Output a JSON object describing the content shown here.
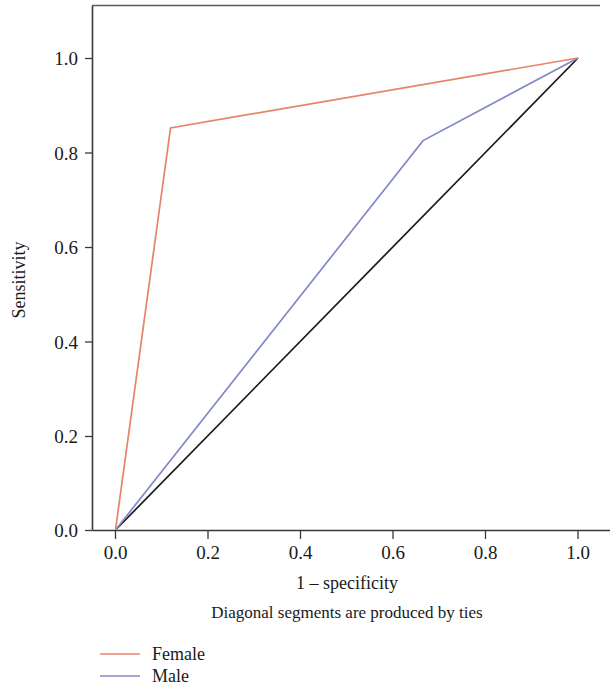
{
  "chart_data": {
    "type": "line",
    "title": "",
    "xlabel": "1 – specificity",
    "ylabel": "Sensitivity",
    "xlim": [
      0.0,
      1.0
    ],
    "ylim": [
      0.0,
      1.0
    ],
    "grid": false,
    "legend_position": "bottom-left",
    "annotation": "Diagonal segments are produced by ties",
    "xticks": [
      "0.0",
      "0.2",
      "0.4",
      "0.6",
      "0.8",
      "1.0"
    ],
    "xtick_values": [
      0.0,
      0.2,
      0.4,
      0.6,
      0.8,
      1.0
    ],
    "yticks": [
      "0.0",
      "0.2",
      "0.4",
      "0.6",
      "0.8",
      "1.0"
    ],
    "ytick_values": [
      0.0,
      0.2,
      0.4,
      0.6,
      0.8,
      1.0
    ],
    "series": [
      {
        "name": "Female",
        "color": "#E8836B",
        "x": [
          0.0,
          0.119,
          1.0
        ],
        "y": [
          0.0,
          0.852,
          1.0
        ]
      },
      {
        "name": "Male",
        "color": "#8288C8",
        "x": [
          0.0,
          0.665,
          1.0
        ],
        "y": [
          0.0,
          0.825,
          1.0
        ]
      },
      {
        "name": "Reference line",
        "color": "#1a1a1a",
        "x": [
          0.0,
          1.0
        ],
        "y": [
          0.0,
          1.0
        ]
      }
    ]
  },
  "axes": {
    "x_title": "1 – specificity",
    "y_title": "Sensitivity",
    "x_tick_labels": [
      "0.0",
      "0.2",
      "0.4",
      "0.6",
      "0.8",
      "1.0"
    ],
    "y_tick_labels": [
      "0.0",
      "0.2",
      "0.4",
      "0.6",
      "0.8",
      "1.0"
    ]
  },
  "caption": {
    "text": "Diagonal segments are produced by ties"
  },
  "legend": {
    "items": [
      {
        "label": "Female",
        "color": "#E8836B"
      },
      {
        "label": "Male",
        "color": "#8288C8"
      }
    ]
  },
  "colors": {
    "female": "#E8836B",
    "male": "#8288C8",
    "reference": "#1a1a1a",
    "frame": "#5a5a5a",
    "background": "#ffffff"
  }
}
